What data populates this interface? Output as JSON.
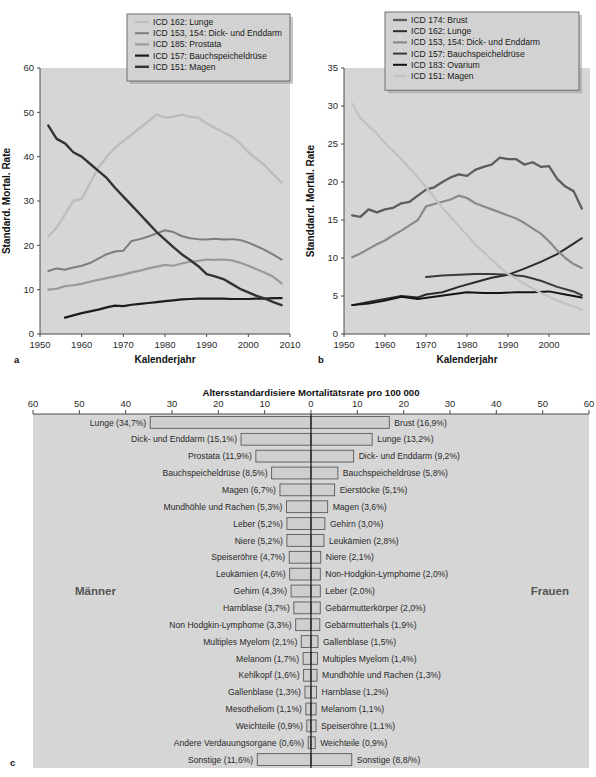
{
  "figure": {
    "panels": [
      "a",
      "b",
      "c"
    ]
  },
  "chart_data": [
    {
      "type": "line",
      "panel": "a",
      "title": "",
      "xlabel": "Kalenderjahr",
      "ylabel": "Standard. Mortal. Rate",
      "xlim": [
        1950,
        2010
      ],
      "ylim": [
        0,
        60
      ],
      "xticks": [
        1950,
        1960,
        1970,
        1980,
        1990,
        2000,
        2010
      ],
      "yticks": [
        0,
        10,
        20,
        30,
        40,
        50,
        60
      ],
      "grid": false,
      "legend_position": "top-right",
      "series": [
        {
          "name": "ICD 162: Lunge",
          "color": "#bdbdbd",
          "width": 2.4,
          "x": [
            1952,
            1954,
            1956,
            1958,
            1960,
            1962,
            1964,
            1966,
            1968,
            1970,
            1972,
            1974,
            1976,
            1978,
            1980,
            1982,
            1984,
            1986,
            1988,
            1990,
            1992,
            1994,
            1996,
            1998,
            2000,
            2002,
            2004,
            2006,
            2008
          ],
          "values": [
            22.0,
            24.0,
            27.0,
            30.0,
            30.5,
            34.0,
            37.5,
            40.0,
            42.0,
            43.5,
            45.0,
            46.5,
            48.0,
            49.5,
            48.8,
            49.0,
            49.5,
            49.0,
            48.8,
            47.5,
            46.5,
            45.5,
            44.5,
            43.0,
            41.0,
            39.5,
            38.0,
            36.0,
            34.2
          ]
        },
        {
          "name": "ICD 153, 154: Dick- und Enddarm",
          "color": "#7d7d7d",
          "width": 2.0,
          "x": [
            1952,
            1954,
            1956,
            1958,
            1960,
            1962,
            1964,
            1966,
            1968,
            1970,
            1972,
            1974,
            1976,
            1978,
            1980,
            1982,
            1984,
            1986,
            1988,
            1990,
            1992,
            1994,
            1996,
            1998,
            2000,
            2002,
            2004,
            2006,
            2008
          ],
          "values": [
            14.2,
            14.8,
            14.5,
            15.0,
            15.4,
            16.0,
            17.0,
            18.0,
            18.6,
            18.8,
            21.0,
            21.4,
            22.0,
            22.7,
            23.4,
            23.0,
            22.1,
            21.6,
            21.4,
            21.3,
            21.5,
            21.3,
            21.4,
            21.2,
            20.6,
            19.8,
            18.9,
            17.9,
            16.8
          ]
        },
        {
          "name": "ICD 185: Prostata",
          "color": "#9a9a9a",
          "width": 2.2,
          "x": [
            1952,
            1954,
            1956,
            1958,
            1960,
            1962,
            1964,
            1966,
            1968,
            1970,
            1972,
            1974,
            1976,
            1978,
            1980,
            1982,
            1984,
            1986,
            1988,
            1990,
            1992,
            1994,
            1996,
            1998,
            2000,
            2002,
            2004,
            2006,
            2008
          ],
          "values": [
            10.0,
            10.2,
            10.8,
            11.0,
            11.3,
            11.8,
            12.2,
            12.6,
            13.0,
            13.4,
            13.9,
            14.3,
            14.8,
            15.2,
            15.6,
            15.4,
            15.9,
            16.3,
            16.5,
            16.8,
            16.7,
            16.8,
            16.6,
            16.1,
            15.4,
            14.6,
            13.8,
            12.9,
            11.4
          ]
        },
        {
          "name": "ICD 157: Bauchspeicheldrüse",
          "color": "#1c1c1c",
          "width": 2.2,
          "x": [
            1956,
            1958,
            1960,
            1962,
            1964,
            1966,
            1968,
            1970,
            1972,
            1974,
            1976,
            1978,
            1980,
            1982,
            1984,
            1986,
            1988,
            1990,
            1992,
            1994,
            1996,
            1998,
            2000,
            2002,
            2004,
            2006,
            2008
          ],
          "values": [
            3.7,
            4.2,
            4.7,
            5.1,
            5.5,
            6.0,
            6.4,
            6.3,
            6.6,
            6.8,
            7.0,
            7.2,
            7.4,
            7.6,
            7.8,
            7.9,
            8.0,
            8.0,
            8.0,
            8.0,
            7.9,
            7.9,
            7.9,
            8.0,
            8.0,
            8.1,
            8.1
          ]
        },
        {
          "name": "ICD 151: Magen",
          "color": "#333333",
          "width": 2.4,
          "x": [
            1952,
            1954,
            1956,
            1958,
            1960,
            1962,
            1964,
            1966,
            1968,
            1970,
            1972,
            1974,
            1976,
            1978,
            1980,
            1982,
            1984,
            1986,
            1988,
            1990,
            1992,
            1994,
            1996,
            1998,
            2000,
            2002,
            2004,
            2006,
            2008
          ],
          "values": [
            47.0,
            44.0,
            43.0,
            41.0,
            40.0,
            38.4,
            36.8,
            35.2,
            33.0,
            31.0,
            29.0,
            27.0,
            25.0,
            23.0,
            21.3,
            19.6,
            18.0,
            16.7,
            15.3,
            13.5,
            13.0,
            12.4,
            11.3,
            10.2,
            9.4,
            8.6,
            8.0,
            7.2,
            6.5
          ]
        }
      ]
    },
    {
      "type": "line",
      "panel": "b",
      "title": "",
      "xlabel": "Kalenderjahr",
      "ylabel": "Standdard. Mortal. Rate",
      "xlim": [
        1950,
        2010
      ],
      "ylim": [
        0,
        35
      ],
      "xticks": [
        1950,
        1960,
        1970,
        1980,
        1990,
        2000
      ],
      "yticks": [
        0,
        5,
        10,
        15,
        20,
        25,
        30,
        35
      ],
      "grid": false,
      "legend_position": "top-right",
      "series": [
        {
          "name": "ICD 174: Brust",
          "color": "#5d5d5d",
          "width": 2.3,
          "x": [
            1952,
            1954,
            1956,
            1958,
            1960,
            1962,
            1964,
            1966,
            1968,
            1970,
            1972,
            1974,
            1976,
            1978,
            1980,
            1982,
            1984,
            1986,
            1988,
            1990,
            1992,
            1994,
            1996,
            1998,
            2000,
            2002,
            2004,
            2006,
            2008
          ],
          "values": [
            15.6,
            15.4,
            16.4,
            16.0,
            16.4,
            16.6,
            17.2,
            17.4,
            18.2,
            19.0,
            19.3,
            20.0,
            20.6,
            21.0,
            20.8,
            21.6,
            22.0,
            22.3,
            23.2,
            23.0,
            23.0,
            22.3,
            22.6,
            22.0,
            22.1,
            20.4,
            19.4,
            18.8,
            16.5
          ]
        },
        {
          "name": "ICD 162: Lunge",
          "color": "#2b2b2b",
          "width": 2.0,
          "x": [
            1952,
            1956,
            1960,
            1964,
            1968,
            1970,
            1974,
            1978,
            1982,
            1986,
            1990,
            1994,
            1998,
            2002,
            2006,
            2008
          ],
          "values": [
            3.8,
            4.2,
            4.6,
            5.0,
            4.8,
            5.2,
            5.5,
            6.2,
            6.8,
            7.4,
            7.8,
            8.6,
            9.5,
            10.5,
            11.9,
            12.6
          ]
        },
        {
          "name": "ICD 153, 154: Dick- und Enddarm",
          "color": "#8a8a8a",
          "width": 2.2,
          "x": [
            1952,
            1954,
            1956,
            1958,
            1960,
            1962,
            1964,
            1966,
            1968,
            1970,
            1972,
            1974,
            1976,
            1978,
            1980,
            1982,
            1984,
            1986,
            1988,
            1990,
            1992,
            1994,
            1996,
            1998,
            2000,
            2002,
            2004,
            2006,
            2008
          ],
          "values": [
            10.1,
            10.6,
            11.2,
            11.8,
            12.3,
            13.0,
            13.6,
            14.3,
            15.0,
            16.8,
            17.1,
            17.4,
            17.7,
            18.2,
            17.9,
            17.2,
            16.8,
            16.4,
            16.0,
            15.6,
            15.2,
            14.6,
            13.9,
            13.2,
            12.2,
            11.0,
            10.0,
            9.2,
            8.7
          ]
        },
        {
          "name": "ICD 157: Bauchspeicheldrüse",
          "color": "#3a3a3a",
          "width": 2.0,
          "x": [
            1970,
            1974,
            1978,
            1982,
            1986,
            1990,
            1994,
            1998,
            2002,
            2006,
            2008
          ],
          "values": [
            7.5,
            7.7,
            7.8,
            7.9,
            7.9,
            7.8,
            7.6,
            7.0,
            6.2,
            5.6,
            5.1
          ]
        },
        {
          "name": "ICD 183: Ovarium",
          "color": "#141414",
          "width": 1.9,
          "x": [
            1952,
            1956,
            1960,
            1964,
            1968,
            1972,
            1976,
            1980,
            1984,
            1988,
            1992,
            1996,
            2000,
            2004,
            2008
          ],
          "values": [
            3.8,
            4.0,
            4.4,
            4.9,
            4.6,
            4.9,
            5.2,
            5.5,
            5.4,
            5.4,
            5.5,
            5.5,
            5.6,
            5.2,
            4.8
          ]
        },
        {
          "name": "ICD 151: Magen",
          "color": "#c2c2c2",
          "width": 2.3,
          "x": [
            1952,
            1954,
            1956,
            1958,
            1960,
            1962,
            1964,
            1966,
            1968,
            1970,
            1972,
            1974,
            1976,
            1978,
            1980,
            1982,
            1984,
            1986,
            1988,
            1990,
            1992,
            1994,
            1996,
            1998,
            2000,
            2002,
            2004,
            2006,
            2008
          ],
          "values": [
            30.3,
            28.4,
            27.4,
            26.4,
            25.1,
            24.1,
            23.0,
            21.8,
            20.6,
            19.3,
            18.0,
            16.6,
            15.4,
            14.2,
            13.0,
            11.8,
            10.8,
            9.8,
            8.8,
            7.9,
            7.3,
            6.6,
            6.0,
            5.4,
            4.9,
            4.4,
            4.0,
            3.6,
            3.2
          ]
        }
      ]
    },
    {
      "type": "bar",
      "panel": "c",
      "orientation": "horizontal-pyramid",
      "title": "Altersstandardisiere Mortalitätsrate pro 100 000",
      "xlim": [
        60,
        60
      ],
      "xticks_left": [
        60,
        50,
        40,
        30,
        20,
        10,
        0
      ],
      "xticks_right": [
        0,
        10,
        20,
        30,
        40,
        50,
        60
      ],
      "left_group_label": "Männer",
      "right_group_label": "Frauen",
      "left": {
        "categories": [
          "Lunge",
          "Dick- und Enddarm",
          "Prostata",
          "Bauchspeicheldrüse",
          "Magen",
          "Mundhöhle und Rachen",
          "Leber",
          "Niere",
          "Speiseröhre",
          "Leukämien",
          "Gehirn",
          "Harnblase",
          "Non Hodgkin-Lymphome",
          "Multiples Myelom",
          "Melanom",
          "Kehlkopf",
          "Gallenblase",
          "Mesotheliom",
          "Weichteile",
          "Andere Verdauungsorgane",
          "Sonstige"
        ],
        "labels": [
          "Lunge (34,7%)",
          "Dick- und Enddarm (15,1%)",
          "Prostata (11,9%)",
          "Bauchspeicheldrüse (8,5%)",
          "Magen (6,7%)",
          "Mundhöhle und Rachen (5,3%)",
          "Leber (5,2%)",
          "Niere (5,2%)",
          "Speiseröhre (4,7%)",
          "Leukämien (4,6%)",
          "Gehirn (4,3%)",
          "Harnblase (3,7%)",
          "Non Hodgkin-Lymphome (3,3%)",
          "Multiples Myelom (2,1%)",
          "Melanom (1,7%)",
          "Kehlkopf (1,6%)",
          "Gallenblase (1,3%)",
          "Mesotheliom (1,1%)",
          "Weichteile (0,9%)",
          "Andere Verdauungsorgane (0,6%)",
          "Sonstige (11,6%)"
        ],
        "values": [
          34.7,
          15.1,
          11.9,
          8.5,
          6.7,
          5.3,
          5.2,
          5.2,
          4.7,
          4.6,
          4.3,
          3.7,
          3.3,
          2.1,
          1.7,
          1.6,
          1.3,
          1.1,
          0.9,
          0.6,
          11.6
        ]
      },
      "right": {
        "categories": [
          "Brust",
          "Lunge",
          "Dick- und Enddarm",
          "Bauchspeicheldrüse",
          "Eierstöcke",
          "Magen",
          "Gehirn",
          "Leukämien",
          "Niere",
          "Non-Hodgkin-Lymphome",
          "Leber",
          "Gebärmutterkörper",
          "Gebärmutterhals",
          "Gallenblase",
          "Multiples Myelom",
          "Mundhöhle und Rachen",
          "Harnblase",
          "Melanom",
          "Speiseröhre",
          "Weichteile",
          "Sonstige"
        ],
        "labels": [
          "Brust (16,9%)",
          "Lunge (13,2%)",
          "Dick- und Enddarm (9,2%)",
          "Bauchspeicheldrüse (5,8%)",
          "Eierstöcke (5,1%)",
          "Magen (3,6%)",
          "Gehirn (3,0%)",
          "Leukämien (2,8%)",
          "Niere (2,1%)",
          "Non-Hodgkin-Lymphome (2,0%)",
          "Leber (2,0%)",
          "Gebärmutterkörper (2,0%)",
          "Gebärmutterhals (1,9%)",
          "Gallenblase (1,5%)",
          "Multiples Myelom (1,4%)",
          "Mundhöhle und Rachen (1,3%)",
          "Harnblase (1,2%)",
          "Melanom (1,1%)",
          "Speiseröhre (1,1%)",
          "Weichteile (0,9%)",
          "Sonstige (8,8/%)"
        ],
        "values": [
          16.9,
          13.2,
          9.2,
          5.8,
          5.1,
          3.6,
          3.0,
          2.8,
          2.1,
          2.0,
          2.0,
          2.0,
          1.9,
          1.5,
          1.4,
          1.3,
          1.2,
          1.1,
          1.1,
          0.9,
          8.8
        ]
      }
    }
  ]
}
